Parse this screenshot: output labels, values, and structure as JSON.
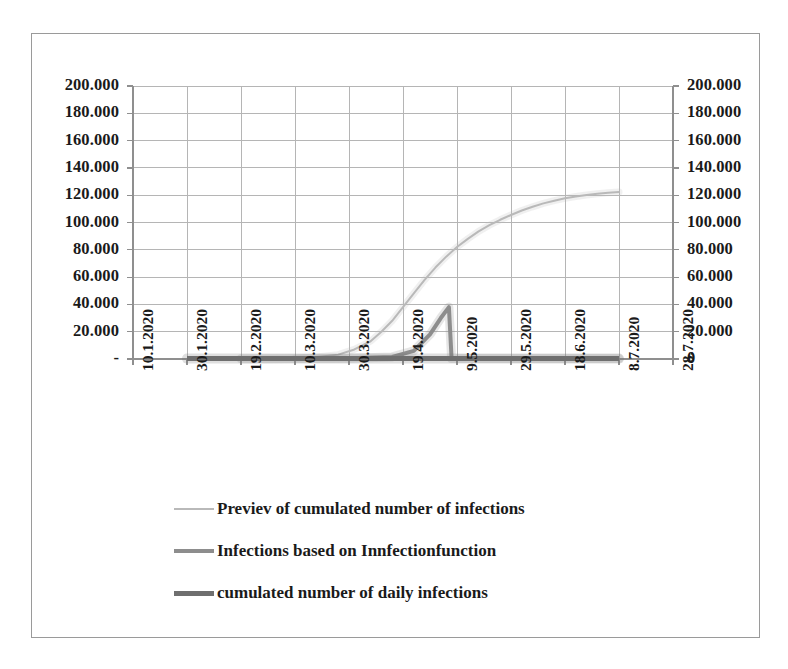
{
  "chart_data": {
    "type": "line",
    "title": "",
    "xlabel": "",
    "ylabel": "",
    "grid": true,
    "legend_position": "bottom",
    "x_tick_labels": [
      "10.1.2020",
      "30.1.2020",
      "19.2.2020",
      "10.3.2020",
      "30.3.2020",
      "19.4.2020",
      "9.5.2020",
      "29.5.2020",
      "18.6.2020",
      "8.7.2020",
      "28.7.2020"
    ],
    "y_left_tick_labels": [
      "200.000",
      "180.000",
      "160.000",
      "140.000",
      "120.000",
      "100.000",
      "80.000",
      "60.000",
      "40.000",
      "20.000",
      "-"
    ],
    "y_right_tick_labels": [
      "200.000",
      "180.000",
      "160.000",
      "140.000",
      "120.000",
      "100.000",
      "80.000",
      "60.000",
      "40.000",
      "20.000",
      "0"
    ],
    "ylim": [
      0,
      200000
    ],
    "y_tick_step": 20000,
    "xlim_dates": [
      "10.1.2020",
      "28.7.2020"
    ],
    "series": [
      {
        "name": "Previev of cumulated number of infections",
        "color": "#b9b9b9",
        "width": 2,
        "x": [
          0.3,
          0.34,
          0.38,
          0.41,
          0.44,
          0.46,
          0.48,
          0.5,
          0.52,
          0.54,
          0.56,
          0.58,
          0.6,
          0.62,
          0.64,
          0.66,
          0.68,
          0.7,
          0.72,
          0.74,
          0.76,
          0.78,
          0.8,
          0.82,
          0.84,
          0.86,
          0.88,
          0.9
        ],
        "values": [
          600,
          1400,
          3200,
          7000,
          13000,
          20000,
          28000,
          38000,
          48000,
          58000,
          67000,
          75000,
          82000,
          88000,
          93500,
          98000,
          102000,
          105500,
          108800,
          111500,
          114000,
          116000,
          117700,
          119100,
          120200,
          121100,
          121800,
          122400
        ]
      },
      {
        "name": "Infections based on Innfectionfunction",
        "color": "#8d8d8d",
        "width": 4,
        "x": [
          0.2,
          0.3,
          0.4,
          0.48,
          0.52,
          0.55,
          0.57,
          0.585,
          0.59,
          0.62,
          0.7,
          0.8,
          0.9
        ],
        "values": [
          200,
          300,
          500,
          1500,
          6000,
          18000,
          30000,
          38000,
          300,
          300,
          300,
          300,
          300
        ]
      },
      {
        "name": "cumulated number of daily infections",
        "color": "#6f6f6f",
        "width": 5,
        "x": [
          0.1,
          0.2,
          0.3,
          0.4,
          0.5,
          0.6,
          0.7,
          0.8,
          0.9
        ],
        "values": [
          300,
          300,
          300,
          300,
          300,
          300,
          300,
          300,
          300
        ]
      }
    ],
    "peak_annotation": {
      "value": 38000,
      "series": "Infections based on Innfectionfunction"
    },
    "plateau_annotation": {
      "value": 122400,
      "series": "Previev of cumulated number of infections"
    }
  },
  "legend": {
    "items": [
      {
        "label": "Previev of cumulated number of infections",
        "color": "#b9b9b9",
        "thickness": "2px"
      },
      {
        "label": "Infections based on Innfectionfunction",
        "color": "#8d8d8d",
        "thickness": "4px"
      },
      {
        "label": "cumulated number of daily infections",
        "color": "#6f6f6f",
        "thickness": "5px"
      }
    ]
  },
  "style": {
    "grid_color": "#b5b5b5",
    "axis_color": "#8f8f8f",
    "border_color": "#9a9a9a",
    "text_color": "#1a1a1a",
    "background": "#ffffff"
  }
}
